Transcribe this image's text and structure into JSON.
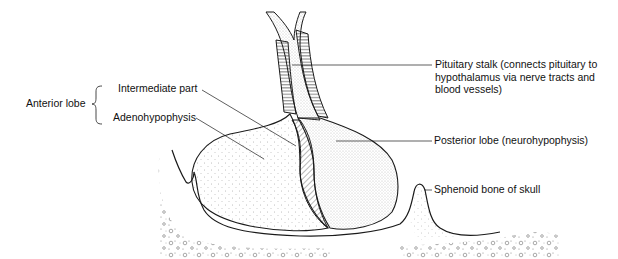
{
  "diagram": {
    "labels": {
      "anterior_lobe": "Anterior lobe",
      "intermediate_part": "Intermediate part",
      "adenohypophysis": "Adenohypophysis",
      "pituitary_stalk": "Pituitary stalk (connects pituitary to\nhypothalamus via nerve tracts and\nblood vessels)",
      "posterior_lobe": "Posterior lobe (neurohypophysis)",
      "sphenoid_bone": "Sphenoid bone of skull"
    },
    "colors": {
      "line": "#1a1a1a",
      "background": "#ffffff",
      "stipple": "#555555"
    }
  }
}
